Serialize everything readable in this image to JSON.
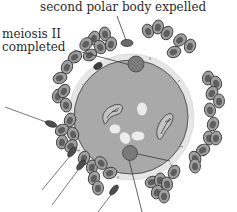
{
  "diagram": {
    "type": "biology-illustration",
    "labels": {
      "top": "second polar body expelled",
      "left_line1": "meiosis II",
      "left_line2": "completed"
    },
    "colors": {
      "background": "#ffffff",
      "oocyte_fill": "#a9a9a9",
      "zona_pellucida": "#e4e4e4",
      "cell_fill": "#9a9a9a",
      "cell_nucleus": "#5e5e5e",
      "outline": "#3a3a3a",
      "pronucleus_fill": "#bdbdbd",
      "vesicle": "#ececec",
      "polar_body": "#6f6f6f",
      "text": "#2a2a2a"
    },
    "elements": [
      "oocyte",
      "zona-pellucida",
      "corona-radiata-cells",
      "sperm",
      "second-polar-body",
      "male-pronucleus",
      "female-pronucleus",
      "cortical-granules"
    ]
  }
}
